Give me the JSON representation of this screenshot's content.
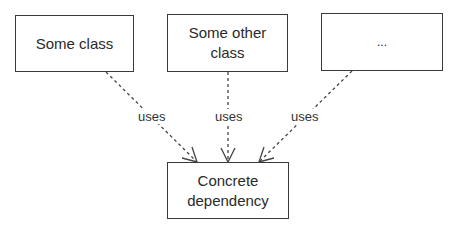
{
  "diagram": {
    "nodes": [
      {
        "id": "some-class",
        "label": "Some class"
      },
      {
        "id": "some-other-class",
        "label": "Some other class"
      },
      {
        "id": "ellipsis",
        "label": "..."
      },
      {
        "id": "concrete-dependency",
        "label": "Concrete dependency"
      }
    ],
    "edges": [
      {
        "from": "some-class",
        "to": "concrete-dependency",
        "label": "uses",
        "style": "dashed"
      },
      {
        "from": "some-other-class",
        "to": "concrete-dependency",
        "label": "uses",
        "style": "dashed"
      },
      {
        "from": "ellipsis",
        "to": "concrete-dependency",
        "label": "uses",
        "style": "dashed"
      }
    ]
  }
}
